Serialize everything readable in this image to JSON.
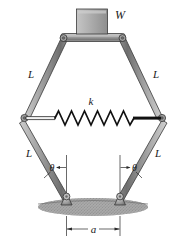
{
  "figure": {
    "type": "mechanism-diagram",
    "background": "#ffffff",
    "title_visible": false,
    "labels": {
      "weight": "W",
      "link_top_left": "L",
      "link_top_right": "L",
      "link_bottom_left": "L",
      "link_bottom_right": "L",
      "spring": "k",
      "angle_left": "θ",
      "angle_right": "θ",
      "base_dimension": "a"
    },
    "colors": {
      "link_fill_light": "#b9b9b9",
      "link_fill_mid": "#8f8f8f",
      "link_fill_dark": "#6a6a6a",
      "outline": "#3a3a3a",
      "block_fill": "#b0b0b0",
      "ground": "#9a9a9a",
      "spring": "#1a1a1a",
      "text": "#1a1a1a"
    },
    "parts": [
      {
        "name": "weight-block",
        "label": "W"
      },
      {
        "name": "top-bar",
        "label": ""
      },
      {
        "name": "upper-left-link",
        "label": "L"
      },
      {
        "name": "upper-right-link",
        "label": "L"
      },
      {
        "name": "lower-left-link",
        "label": "L"
      },
      {
        "name": "lower-right-link",
        "label": "L"
      },
      {
        "name": "spring",
        "label": "k"
      },
      {
        "name": "left-pivot",
        "label": ""
      },
      {
        "name": "right-pivot",
        "label": ""
      },
      {
        "name": "left-pin-support",
        "label": ""
      },
      {
        "name": "right-pin-support",
        "label": ""
      },
      {
        "name": "ground",
        "label": ""
      },
      {
        "name": "dimension-a",
        "label": "a"
      }
    ],
    "spring_coils": 8
  }
}
